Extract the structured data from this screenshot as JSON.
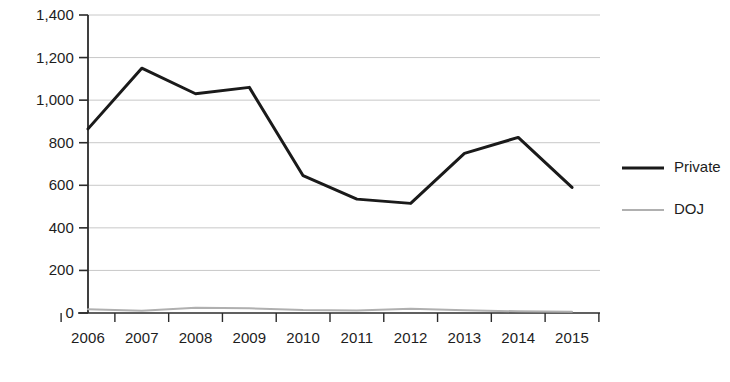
{
  "chart_data": {
    "type": "line",
    "title": "",
    "subtitle": "",
    "xlabel": "",
    "ylabel": "",
    "categories": [
      "2006",
      "2007",
      "2008",
      "2009",
      "2010",
      "2011",
      "2012",
      "2013",
      "2014",
      "2015"
    ],
    "x": [
      2006,
      2007,
      2008,
      2009,
      2010,
      2011,
      2012,
      2013,
      2014,
      2015
    ],
    "series": [
      {
        "name": "Private",
        "color": "#1a1a1a",
        "values": [
          865,
          1150,
          1030,
          1060,
          645,
          535,
          515,
          750,
          825,
          590
        ]
      },
      {
        "name": "DOJ",
        "color": "#b0b0b0",
        "values": [
          18,
          10,
          25,
          22,
          14,
          12,
          20,
          13,
          8,
          6
        ]
      }
    ],
    "ylim": [
      0,
      1400
    ],
    "yticks": [
      0,
      200,
      400,
      600,
      800,
      1000,
      1200,
      1400
    ],
    "ytick_labels": [
      "0",
      "200",
      "400",
      "600",
      "800",
      "1,000",
      "1,200",
      "1,400"
    ],
    "xtick_labels": [
      "2006",
      "2007",
      "2008",
      "2009",
      "2010",
      "2011",
      "2012",
      "2013",
      "2014",
      "2015"
    ],
    "grid": true,
    "grid_color": "#c8c8c8",
    "axis_color": "#2b2b2b",
    "legend_position": "right",
    "legend": [
      {
        "label": "Private",
        "color": "#1a1a1a",
        "width": 3
      },
      {
        "label": "DOJ",
        "color": "#b0b0b0",
        "width": 2
      }
    ]
  }
}
